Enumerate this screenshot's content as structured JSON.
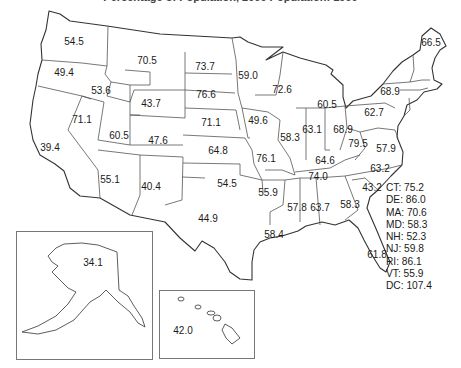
{
  "title": "Percentage of Population, 2000 Population: 1990",
  "chart_data": {
    "type": "map",
    "title": "Percentage of Population, 2000 Population: 1990",
    "region": "United States",
    "value_format": "one decimal",
    "states": [
      {
        "abbr": "WA",
        "value": 54.5,
        "x": 74,
        "y": 42
      },
      {
        "abbr": "OR",
        "value": 49.4,
        "x": 64,
        "y": 73
      },
      {
        "abbr": "ID",
        "value": 53.6,
        "x": 101,
        "y": 91
      },
      {
        "abbr": "MT",
        "value": 70.5,
        "x": 147,
        "y": 61
      },
      {
        "abbr": "WY",
        "value": 43.7,
        "x": 151,
        "y": 104
      },
      {
        "abbr": "ND",
        "value": 73.7,
        "x": 205,
        "y": 67
      },
      {
        "abbr": "SD",
        "value": 76.6,
        "x": 206,
        "y": 95
      },
      {
        "abbr": "NE",
        "value": 71.1,
        "x": 211,
        "y": 123
      },
      {
        "abbr": "KS",
        "value": 64.8,
        "x": 218,
        "y": 151
      },
      {
        "abbr": "OK",
        "value": 54.5,
        "x": 227,
        "y": 184
      },
      {
        "abbr": "TX",
        "value": 44.9,
        "x": 208,
        "y": 219
      },
      {
        "abbr": "CA",
        "value": 39.4,
        "x": 50,
        "y": 148
      },
      {
        "abbr": "NV",
        "value": 71.1,
        "x": 82,
        "y": 120
      },
      {
        "abbr": "UT",
        "value": 60.5,
        "x": 119,
        "y": 136
      },
      {
        "abbr": "CO",
        "value": 47.6,
        "x": 158,
        "y": 141
      },
      {
        "abbr": "AZ",
        "value": 55.1,
        "x": 110,
        "y": 180
      },
      {
        "abbr": "NM",
        "value": 40.4,
        "x": 151,
        "y": 187
      },
      {
        "abbr": "MN",
        "value": 59.0,
        "x": 248,
        "y": 76
      },
      {
        "abbr": "WI",
        "value": 72.6,
        "x": 282,
        "y": 90
      },
      {
        "abbr": "MI",
        "value": 60.5,
        "x": 327,
        "y": 105
      },
      {
        "abbr": "IA",
        "value": 49.6,
        "x": 258,
        "y": 121
      },
      {
        "abbr": "IL",
        "value": 58.3,
        "x": 290,
        "y": 138
      },
      {
        "abbr": "IN",
        "value": 63.1,
        "x": 312,
        "y": 130
      },
      {
        "abbr": "OH",
        "value": 68.9,
        "x": 343,
        "y": 130
      },
      {
        "abbr": "MO",
        "value": 76.1,
        "x": 266,
        "y": 159
      },
      {
        "abbr": "AR",
        "value": 55.9,
        "x": 268,
        "y": 193
      },
      {
        "abbr": "LA",
        "value": 58.4,
        "x": 274,
        "y": 235
      },
      {
        "abbr": "MS",
        "value": 57.8,
        "x": 297,
        "y": 208
      },
      {
        "abbr": "AL",
        "value": 63.7,
        "x": 320,
        "y": 208
      },
      {
        "abbr": "GA",
        "value": 58.3,
        "x": 350,
        "y": 205
      },
      {
        "abbr": "FL",
        "value": 61.8,
        "x": 377,
        "y": 255
      },
      {
        "abbr": "SC",
        "value": 43.2,
        "x": 372,
        "y": 188
      },
      {
        "abbr": "NC",
        "value": 63.2,
        "x": 380,
        "y": 169
      },
      {
        "abbr": "TN",
        "value": 74.0,
        "x": 318,
        "y": 177
      },
      {
        "abbr": "KY",
        "value": 64.6,
        "x": 325,
        "y": 161
      },
      {
        "abbr": "WV",
        "value": 79.5,
        "x": 358,
        "y": 144
      },
      {
        "abbr": "VA",
        "value": 57.9,
        "x": 386,
        "y": 149
      },
      {
        "abbr": "PA",
        "value": 62.7,
        "x": 374,
        "y": 113
      },
      {
        "abbr": "NY",
        "value": 68.9,
        "x": 390,
        "y": 92
      },
      {
        "abbr": "ME",
        "value": 66.5,
        "x": 431,
        "y": 43
      },
      {
        "abbr": "AK",
        "value": 34.1,
        "x": 93,
        "y": 263
      },
      {
        "abbr": "HI",
        "value": 42.0,
        "x": 183,
        "y": 331
      }
    ],
    "small_states_legend": [
      {
        "abbr": "CT",
        "value": 75.2
      },
      {
        "abbr": "DE",
        "value": 86.0
      },
      {
        "abbr": "MA",
        "value": 70.6
      },
      {
        "abbr": "MD",
        "value": 58.3
      },
      {
        "abbr": "NH",
        "value": 52.3
      },
      {
        "abbr": "NJ",
        "value": 59.8
      },
      {
        "abbr": "RI",
        "value": 86.1
      },
      {
        "abbr": "VT",
        "value": 55.9
      },
      {
        "abbr": "DC",
        "value": 107.4
      }
    ],
    "insets": [
      "Alaska",
      "Hawaii"
    ]
  },
  "legend_rows": [
    "CT: 75.2",
    "DE: 86.0",
    "MA: 70.6",
    "MD: 58.3",
    "NH: 52.3",
    "NJ: 59.8",
    "RI: 86.1",
    "VT: 55.9",
    "DC: 107.4"
  ],
  "colors": {
    "outline": "#333333",
    "border": "#555555",
    "inset_frame": "#777777",
    "text": "#1a1a1a",
    "background": "#ffffff"
  }
}
